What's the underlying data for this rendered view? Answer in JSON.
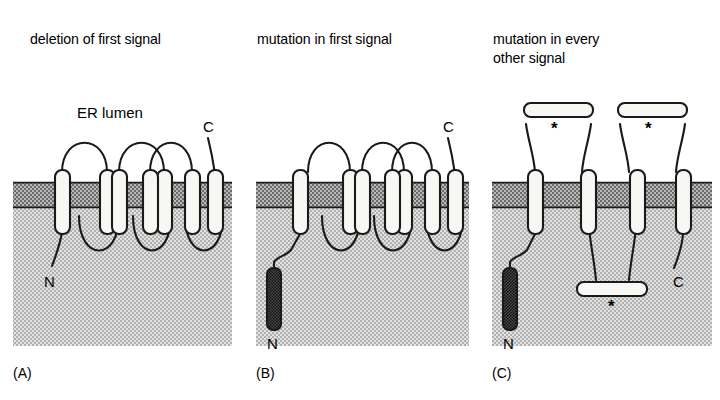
{
  "figure": {
    "background": "#ffffff",
    "stroke": "#1a1a1a",
    "membrane_fill": "#9a9a9a",
    "cytosol_fill": "#c8c8c8",
    "helix_fill": "#f7f7f4",
    "dark_segment_fill": "#555555"
  },
  "panels": [
    {
      "id": "A",
      "label": "(A)",
      "title": "deletion of first signal",
      "annotations": {
        "lumen": "ER lumen",
        "n_terminus": "N",
        "c_terminus": "C"
      },
      "helix_count": 7,
      "lumenal_loops": 3,
      "cytosolic_loops": 3,
      "stars": []
    },
    {
      "id": "B",
      "label": "(B)",
      "title": "mutation in first signal",
      "annotations": {
        "n_terminus": "N",
        "c_terminus": "C"
      },
      "helix_count": 7,
      "lumenal_loops": 3,
      "cytosolic_loops": 3,
      "stars": []
    },
    {
      "id": "C",
      "label": "(C)",
      "title": "mutation in every other signal",
      "title_line1": "mutation in every",
      "title_line2": "other signal",
      "annotations": {
        "n_terminus": "N",
        "c_terminus": "C"
      },
      "helix_count": 4,
      "lumenal_loops": 2,
      "cytosolic_loops": 1,
      "stars": [
        "*",
        "*",
        "*"
      ],
      "star_count": 3
    }
  ]
}
